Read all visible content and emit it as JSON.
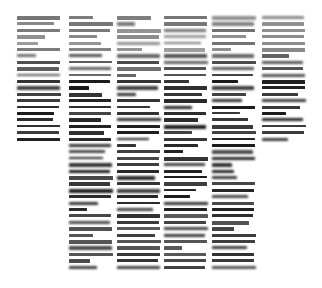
{
  "page": {
    "kind": "document-page-scan",
    "width": 322,
    "height": 288,
    "background_color": "#ffffff",
    "ink_color": "#1a1a1a",
    "legibility": "illegible",
    "legibility_note": "Body text is rendered far below legible resolution; individual glyphs are not resolvable and appear as horizontal grey strokes.",
    "column_count_upper": 6,
    "column_count_lower": 4,
    "reading_order": "left-to-right columns"
  },
  "layout": {
    "text_top": 16,
    "text_bottom": 272,
    "line_pitch": 6.4,
    "line_thickness": 3.1,
    "columns": [
      {
        "id": "column-1",
        "index": 1,
        "x": 17,
        "width": 44,
        "top": 16,
        "bottom": 148,
        "present_in_lower_half": false
      },
      {
        "id": "column-2",
        "index": 2,
        "x": 69,
        "width": 44,
        "top": 16,
        "bottom": 272,
        "present_in_lower_half": true
      },
      {
        "id": "column-3",
        "index": 3,
        "x": 117,
        "width": 44,
        "top": 16,
        "bottom": 272,
        "present_in_lower_half": true
      },
      {
        "id": "column-4",
        "index": 4,
        "x": 164,
        "width": 44,
        "top": 16,
        "bottom": 272,
        "present_in_lower_half": true
      },
      {
        "id": "column-5",
        "index": 5,
        "x": 212,
        "width": 44,
        "top": 16,
        "bottom": 272,
        "present_in_lower_half": true
      },
      {
        "id": "column-6",
        "index": 6,
        "x": 262,
        "width": 44,
        "top": 16,
        "bottom": 145,
        "present_in_lower_half": false
      }
    ]
  },
  "density_bands": [
    {
      "from": 16,
      "to": 52,
      "weight": "light",
      "opacity": 0.52
    },
    {
      "from": 52,
      "to": 74,
      "weight": "medium",
      "opacity": 0.72
    },
    {
      "from": 74,
      "to": 150,
      "weight": "heavy",
      "opacity": 0.92
    },
    {
      "from": 150,
      "to": 210,
      "weight": "heavy",
      "opacity": 0.9
    },
    {
      "from": 210,
      "to": 272,
      "weight": "medium",
      "opacity": 0.8
    }
  ],
  "text_content": {
    "readable_strings": [],
    "note": "No text in this image is legible at the captured resolution; no headings, labels, numbers, captions or page numbers can be transcribed."
  },
  "accessibility": {
    "summary": "Scanned or rendered page of a six-column document at very small scale. Upper portion spans six columns of dense body text; the lower portion narrows to the four interior columns. All text is unresolvable."
  }
}
